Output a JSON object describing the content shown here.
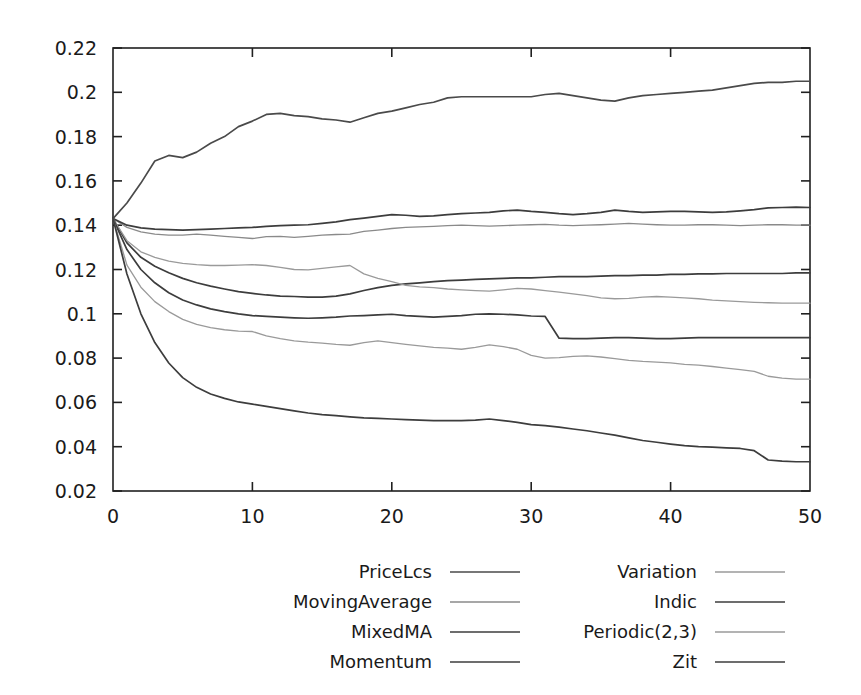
{
  "chart_data": {
    "type": "line",
    "title": "",
    "xlabel": "",
    "ylabel": "",
    "xlim": [
      0,
      50
    ],
    "ylim": [
      0.02,
      0.22
    ],
    "grid": false,
    "legend_position": "bottom",
    "xticks": [
      0,
      10,
      20,
      30,
      40,
      50
    ],
    "xtick_labels": [
      "0",
      "10",
      "20",
      "30",
      "40",
      "50"
    ],
    "yticks": [
      0.02,
      0.04,
      0.06,
      0.08,
      0.1,
      0.12,
      0.14,
      0.16,
      0.18,
      0.2,
      0.22
    ],
    "ytick_labels": [
      "0.02",
      "0.04",
      "0.06",
      "0.08",
      "0.1",
      "0.12",
      "0.14",
      "0.16",
      "0.18",
      "0.2",
      "0.22"
    ],
    "x": [
      0,
      1,
      2,
      3,
      4,
      5,
      6,
      7,
      8,
      9,
      10,
      11,
      12,
      13,
      14,
      15,
      16,
      17,
      18,
      19,
      20,
      21,
      22,
      23,
      24,
      25,
      26,
      27,
      28,
      29,
      30,
      31,
      32,
      33,
      34,
      35,
      36,
      37,
      38,
      39,
      40,
      41,
      42,
      43,
      44,
      45,
      46,
      47,
      48,
      49,
      50
    ],
    "series": [
      {
        "name": "PriceLcs",
        "color": "#4a4a4a",
        "width": 1.7,
        "values": [
          0.143,
          0.15,
          0.159,
          0.169,
          0.1715,
          0.1705,
          0.173,
          0.177,
          0.18,
          0.1845,
          0.187,
          0.19,
          0.1905,
          0.1895,
          0.189,
          0.188,
          0.1875,
          0.1865,
          0.1885,
          0.1905,
          0.1915,
          0.193,
          0.1945,
          0.1955,
          0.1975,
          0.198,
          0.198,
          0.198,
          0.198,
          0.198,
          0.198,
          0.199,
          0.1995,
          0.1985,
          0.1975,
          0.1965,
          0.196,
          0.1975,
          0.1985,
          0.199,
          0.1995,
          0.2,
          0.2005,
          0.201,
          0.202,
          0.203,
          0.204,
          0.2045,
          0.2045,
          0.205,
          0.205
        ]
      },
      {
        "name": "MovingAverage",
        "color": "#8a8a8a",
        "width": 1.3,
        "values": [
          0.143,
          0.139,
          0.137,
          0.136,
          0.1355,
          0.1355,
          0.136,
          0.1355,
          0.135,
          0.1345,
          0.134,
          0.1348,
          0.135,
          0.1345,
          0.135,
          0.1355,
          0.1358,
          0.136,
          0.1372,
          0.1378,
          0.1385,
          0.139,
          0.1392,
          0.1395,
          0.1398,
          0.14,
          0.1398,
          0.1396,
          0.1398,
          0.14,
          0.1402,
          0.1404,
          0.14,
          0.1398,
          0.14,
          0.1402,
          0.1405,
          0.1408,
          0.1405,
          0.1402,
          0.14,
          0.14,
          0.1402,
          0.1402,
          0.14,
          0.1398,
          0.14,
          0.1402,
          0.1402,
          0.14,
          0.14
        ]
      },
      {
        "name": "MixedMA",
        "color": "#3d3d3d",
        "width": 1.7,
        "values": [
          0.143,
          0.14,
          0.1388,
          0.1382,
          0.138,
          0.1378,
          0.138,
          0.1382,
          0.1385,
          0.1388,
          0.139,
          0.1395,
          0.1398,
          0.14,
          0.1402,
          0.1408,
          0.1415,
          0.1425,
          0.1432,
          0.144,
          0.1448,
          0.1445,
          0.144,
          0.1442,
          0.1448,
          0.1452,
          0.1455,
          0.1458,
          0.1465,
          0.1468,
          0.1462,
          0.1458,
          0.1452,
          0.1448,
          0.1452,
          0.1458,
          0.1468,
          0.1462,
          0.1458,
          0.146,
          0.1462,
          0.1462,
          0.146,
          0.1458,
          0.146,
          0.1465,
          0.147,
          0.1478,
          0.148,
          0.1482,
          0.148
        ]
      },
      {
        "name": "Momentum",
        "color": "#3d3d3d",
        "width": 1.7,
        "values": [
          0.143,
          0.132,
          0.1255,
          0.1215,
          0.1185,
          0.116,
          0.114,
          0.1125,
          0.1112,
          0.11,
          0.1092,
          0.1085,
          0.108,
          0.1078,
          0.1075,
          0.1075,
          0.108,
          0.109,
          0.1105,
          0.1118,
          0.1128,
          0.1135,
          0.114,
          0.1145,
          0.115,
          0.1152,
          0.1155,
          0.1158,
          0.116,
          0.1162,
          0.1162,
          0.1165,
          0.1168,
          0.1168,
          0.1168,
          0.117,
          0.1172,
          0.1172,
          0.1175,
          0.1175,
          0.1178,
          0.1178,
          0.118,
          0.118,
          0.1182,
          0.1182,
          0.1182,
          0.1182,
          0.1182,
          0.1185,
          0.1185
        ]
      },
      {
        "name": "Variation",
        "color": "#9a9a9a",
        "width": 1.3,
        "values": [
          0.143,
          0.133,
          0.128,
          0.1255,
          0.1238,
          0.1228,
          0.1222,
          0.1218,
          0.1218,
          0.122,
          0.1222,
          0.1218,
          0.121,
          0.12,
          0.1198,
          0.1205,
          0.1212,
          0.1218,
          0.118,
          0.116,
          0.1145,
          0.1128,
          0.1122,
          0.1118,
          0.1112,
          0.1108,
          0.1105,
          0.1102,
          0.1108,
          0.1115,
          0.1112,
          0.1105,
          0.1098,
          0.109,
          0.1082,
          0.1072,
          0.1068,
          0.107,
          0.1075,
          0.1078,
          0.1075,
          0.1072,
          0.1068,
          0.1062,
          0.1058,
          0.1055,
          0.1052,
          0.105,
          0.1048,
          0.1048,
          0.1048
        ]
      },
      {
        "name": "Indic",
        "color": "#3d3d3d",
        "width": 1.7,
        "values": [
          0.143,
          0.129,
          0.12,
          0.114,
          0.1095,
          0.1062,
          0.104,
          0.1022,
          0.101,
          0.1,
          0.0992,
          0.0988,
          0.0985,
          0.0982,
          0.098,
          0.0982,
          0.0985,
          0.099,
          0.0992,
          0.0995,
          0.0998,
          0.0992,
          0.0988,
          0.0985,
          0.0988,
          0.0992,
          0.0998,
          0.1,
          0.0998,
          0.0995,
          0.099,
          0.0988,
          0.089,
          0.0888,
          0.0888,
          0.089,
          0.0892,
          0.0892,
          0.089,
          0.0888,
          0.0888,
          0.089,
          0.0892,
          0.0892,
          0.0892,
          0.0892,
          0.0892,
          0.0892,
          0.0892,
          0.0892,
          0.0892
        ]
      },
      {
        "name": "Periodic(2,3)",
        "color": "#9a9a9a",
        "width": 1.3,
        "values": [
          0.143,
          0.122,
          0.112,
          0.1055,
          0.101,
          0.0975,
          0.0952,
          0.0938,
          0.0928,
          0.0922,
          0.092,
          0.09,
          0.0888,
          0.0878,
          0.0872,
          0.0868,
          0.0862,
          0.0858,
          0.087,
          0.0878,
          0.087,
          0.0862,
          0.0855,
          0.0848,
          0.0845,
          0.084,
          0.0848,
          0.086,
          0.0852,
          0.084,
          0.0812,
          0.08,
          0.0802,
          0.0808,
          0.081,
          0.0805,
          0.0798,
          0.079,
          0.0785,
          0.0782,
          0.0778,
          0.0772,
          0.0768,
          0.0762,
          0.0755,
          0.0748,
          0.074,
          0.0718,
          0.071,
          0.0705,
          0.0705
        ]
      },
      {
        "name": "Zit",
        "color": "#3d3d3d",
        "width": 1.7,
        "values": [
          0.143,
          0.118,
          0.1,
          0.087,
          0.0778,
          0.0712,
          0.0668,
          0.0638,
          0.0618,
          0.0602,
          0.0592,
          0.0582,
          0.0572,
          0.0562,
          0.0552,
          0.0545,
          0.054,
          0.0535,
          0.053,
          0.0528,
          0.0525,
          0.0522,
          0.052,
          0.0518,
          0.0518,
          0.0518,
          0.052,
          0.0525,
          0.0518,
          0.051,
          0.05,
          0.0495,
          0.0488,
          0.048,
          0.0472,
          0.0462,
          0.0452,
          0.044,
          0.0428,
          0.042,
          0.0412,
          0.0405,
          0.04,
          0.0398,
          0.0395,
          0.0392,
          0.0382,
          0.034,
          0.0335,
          0.0332,
          0.0332
        ]
      }
    ]
  },
  "legend": {
    "entries": [
      {
        "label": "PriceLcs",
        "color": "#4a4a4a",
        "width": 1.7,
        "col": 0,
        "row": 0
      },
      {
        "label": "MovingAverage",
        "color": "#8a8a8a",
        "width": 1.3,
        "col": 0,
        "row": 1
      },
      {
        "label": "MixedMA",
        "color": "#3d3d3d",
        "width": 1.7,
        "col": 0,
        "row": 2
      },
      {
        "label": "Momentum",
        "color": "#3d3d3d",
        "width": 1.7,
        "col": 0,
        "row": 3
      },
      {
        "label": "Variation",
        "color": "#9a9a9a",
        "width": 1.3,
        "col": 1,
        "row": 0
      },
      {
        "label": "Indic",
        "color": "#3d3d3d",
        "width": 1.7,
        "col": 1,
        "row": 1
      },
      {
        "label": "Periodic(2,3)",
        "color": "#9a9a9a",
        "width": 1.3,
        "col": 1,
        "row": 2
      },
      {
        "label": "Zit",
        "color": "#3d3d3d",
        "width": 1.7,
        "col": 1,
        "row": 3
      }
    ]
  },
  "style": {
    "background": "#ffffff",
    "axis_color": "#202020",
    "text_color": "#1a1a1a"
  }
}
